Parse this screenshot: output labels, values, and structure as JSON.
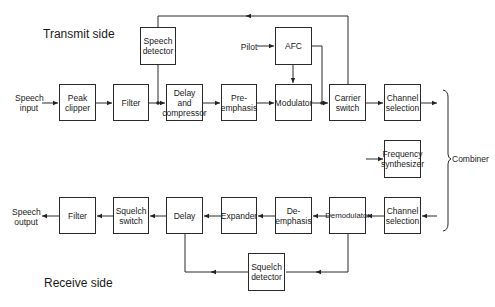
{
  "titles": {
    "transmit": "Transmit side",
    "receive": "Receive side"
  },
  "transmit": {
    "input_label": "Speech\ninput",
    "peak_clipper": "Peak\nclipper",
    "filter": "Filter",
    "speech_detector": "Speech\ndetector",
    "delay_compressor": "Delay\nand\ncompressor",
    "pre_emphasis": "Pre-\nemphasis",
    "pilot_label": "Pilot",
    "afc": "AFC",
    "modulator": "Modulator",
    "carrier_switch": "Carrier\nswitch",
    "channel_selection": "Channel\nselection"
  },
  "shared": {
    "frequency_synthesizer": "Frequency\nsynthesizer",
    "combiner_label": "Combiner"
  },
  "receive": {
    "channel_selection": "Channel\nselection",
    "demodulator": "Demodulator",
    "de_emphasis": "De-\nemphasis",
    "expander": "Expander",
    "delay": "Delay",
    "squelch_switch": "Squelch\nswitch",
    "filter": "Filter",
    "output_label": "Speech\noutput",
    "squelch_detector": "Squelch\ndetector"
  }
}
